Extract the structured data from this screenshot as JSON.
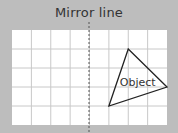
{
  "title": "Mirror line",
  "object_label": "Object",
  "grid": {
    "columns": 8,
    "rows": 5
  },
  "mirror_line": {
    "after_column": 4,
    "style": "dashed"
  },
  "object": {
    "shape": "triangle",
    "vertices_grid_units": [
      [
        6.0,
        1.0
      ],
      [
        8.0,
        3.0
      ],
      [
        5.0,
        4.0
      ]
    ]
  },
  "colors": {
    "background": "#bdbdbd",
    "grid_fill": "#ffffff",
    "grid_line": "#c8c8c8",
    "ink": "#222222"
  }
}
